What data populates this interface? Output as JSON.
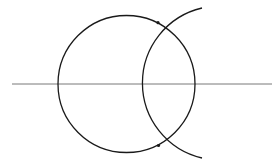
{
  "diagram": {
    "title": "",
    "colors": {
      "stroke": "#1a1a1a",
      "line": "#555555",
      "background": "#ffffff"
    },
    "line": {
      "x1": 12,
      "y1": 84,
      "x2": 272,
      "y2": 84
    },
    "circle": {
      "cx": 126.5,
      "cy": 84,
      "r": 68.5
    },
    "arc": {
      "cx": 205,
      "cy": 84,
      "r": 77,
      "start": [
        202,
        8
      ],
      "end": [
        202,
        158
      ]
    },
    "intersection_points": [
      {
        "x": 158,
        "y": 22.7
      },
      {
        "x": 158.5,
        "y": 145.5
      }
    ]
  }
}
